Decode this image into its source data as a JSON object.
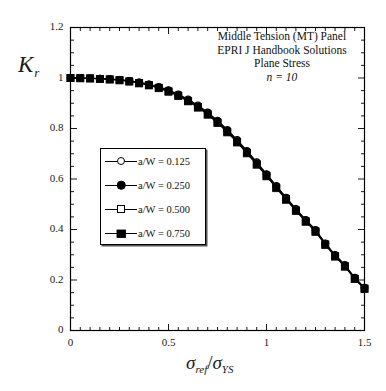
{
  "chart_data": {
    "type": "line",
    "title": "",
    "annotation_lines": [
      "Middle Tension (MT) Panel",
      "EPRI J Handbook Solutions",
      "Plane Stress",
      "n = 10"
    ],
    "xlabel": "σ_ref/σ_YS",
    "ylabel": "K_r",
    "xlim": [
      0,
      1.5
    ],
    "ylim": [
      0,
      1.2
    ],
    "xticks": [
      0,
      0.5,
      1,
      1.5
    ],
    "xtick_labels": [
      "0",
      "0.5",
      "1",
      "1.5"
    ],
    "yticks": [
      0,
      0.2,
      0.4,
      0.6,
      0.8,
      1,
      1.2
    ],
    "ytick_labels": [
      "0",
      "0.2",
      "0.4",
      "0.6",
      "0.8",
      "1",
      "1.2"
    ],
    "x_minor_step": 0.05,
    "y_minor_step": 0.05,
    "grid": false,
    "legend_position": "center-left",
    "x": [
      0.0,
      0.05,
      0.1,
      0.15,
      0.2,
      0.25,
      0.3,
      0.35,
      0.4,
      0.45,
      0.5,
      0.55,
      0.6,
      0.65,
      0.7,
      0.75,
      0.8,
      0.85,
      0.9,
      0.95,
      1.0,
      1.05,
      1.1,
      1.15,
      1.2,
      1.25,
      1.3,
      1.35,
      1.4,
      1.45,
      1.5
    ],
    "series": [
      {
        "name": "a/W = 0.125",
        "marker": "circle-open",
        "values": [
          1.0,
          1.0,
          0.999,
          0.998,
          0.996,
          0.993,
          0.989,
          0.983,
          0.975,
          0.965,
          0.952,
          0.936,
          0.916,
          0.892,
          0.864,
          0.832,
          0.795,
          0.755,
          0.712,
          0.667,
          0.62,
          0.573,
          0.527,
          0.482,
          0.439,
          0.399,
          0.346,
          0.3,
          0.26,
          0.21,
          0.17
        ]
      },
      {
        "name": "a/W = 0.250",
        "marker": "circle-filled",
        "values": [
          1.0,
          1.0,
          0.999,
          0.998,
          0.996,
          0.993,
          0.989,
          0.983,
          0.975,
          0.964,
          0.951,
          0.934,
          0.913,
          0.889,
          0.861,
          0.829,
          0.792,
          0.752,
          0.709,
          0.664,
          0.618,
          0.571,
          0.525,
          0.48,
          0.437,
          0.397,
          0.344,
          0.298,
          0.258,
          0.208,
          0.168
        ]
      },
      {
        "name": "a/W = 0.500",
        "marker": "square-open",
        "values": [
          1.0,
          1.0,
          0.999,
          0.997,
          0.995,
          0.992,
          0.987,
          0.981,
          0.973,
          0.962,
          0.948,
          0.931,
          0.91,
          0.886,
          0.857,
          0.825,
          0.788,
          0.748,
          0.705,
          0.66,
          0.614,
          0.567,
          0.521,
          0.477,
          0.434,
          0.394,
          0.342,
          0.296,
          0.256,
          0.206,
          0.167
        ]
      },
      {
        "name": "a/W = 0.750",
        "marker": "square-filled",
        "values": [
          1.0,
          0.999,
          0.998,
          0.996,
          0.994,
          0.991,
          0.986,
          0.979,
          0.971,
          0.96,
          0.946,
          0.929,
          0.908,
          0.883,
          0.855,
          0.822,
          0.785,
          0.745,
          0.702,
          0.657,
          0.611,
          0.564,
          0.518,
          0.474,
          0.431,
          0.391,
          0.339,
          0.293,
          0.253,
          0.204,
          0.165
        ]
      }
    ]
  },
  "legend": {
    "items": [
      {
        "label": "a/W = 0.125",
        "marker": "circle-open"
      },
      {
        "label": "a/W = 0.250",
        "marker": "circle-filled"
      },
      {
        "label": "a/W = 0.500",
        "marker": "square-open"
      },
      {
        "label": "a/W = 0.750",
        "marker": "square-filled"
      }
    ]
  },
  "axes": {
    "y_title_main": "K",
    "y_title_sub": "r",
    "x_title_num": "σ",
    "x_title_num_sub": "ref",
    "x_title_slash": "/",
    "x_title_den": "σ",
    "x_title_den_sub": "YS"
  },
  "style": {
    "line_color": "#000000",
    "axis_color": "#000000",
    "background": "#ffffff"
  }
}
